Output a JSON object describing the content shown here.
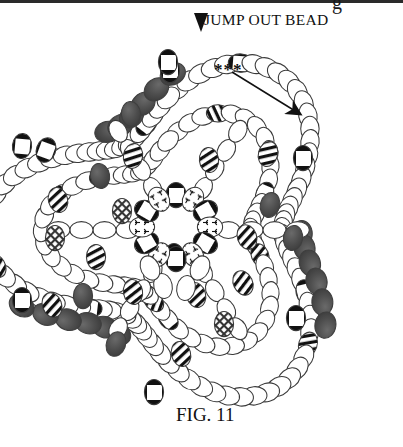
{
  "figure": {
    "label": "F",
    "label_small_caps": "IG",
    "label_rest": ". 11",
    "label_full": "FIG. 11",
    "caption_position": "bottom-center"
  },
  "annotations": {
    "jump_out_bead": {
      "text": "JUMP OUT BEAD",
      "marker_icon": "down-triangle-icon",
      "marker_color": "#111111"
    },
    "stars": {
      "text": "***",
      "arrow_icon": "arrow-down-right-icon",
      "arrow_color": "#111111"
    }
  },
  "colors": {
    "background": "#ffffff",
    "bead_outline": "#3a3a3a",
    "bead_fill_empty": "#ffffff",
    "bead_fill_dark": "#494949",
    "bead_fill_dark_alt": "#5a5a5a",
    "pattern_ink": "#111111",
    "text": "#111111",
    "scan_band": "#2a2a2a"
  },
  "bead_types": {
    "outline": "plain white oval bead",
    "dark": "solid dark filled oval bead",
    "grid": "window-pane grid patterned bead",
    "diagonal": "diagonal striped bead",
    "checker": "cross-hatch checkered bead",
    "sprig": "small sprig/floral patterned bead"
  },
  "chart_data": {
    "type": "diagram",
    "title": "FIG. 11",
    "counts": {
      "outer_ring_beads": 96,
      "dark_accent_beads": 18,
      "grid_pattern_beads": 12,
      "diagonal_pattern_beads": 14,
      "checker_pattern_beads": 4,
      "sprig_pattern_beads": 8
    }
  }
}
